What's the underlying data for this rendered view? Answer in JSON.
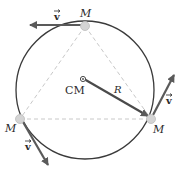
{
  "diagram": {
    "masses": [
      {
        "label": "M",
        "position": "top"
      },
      {
        "label": "M",
        "position": "bottom-right"
      },
      {
        "label": "M",
        "position": "bottom-left"
      }
    ],
    "velocity_label": "v",
    "center_label": "CM",
    "radius_label": "R",
    "colors": {
      "circle": "#3a3a3a",
      "arrow": "#5a5a5a",
      "dashed": "#c8c8c8",
      "mass": "#d4d4d4"
    }
  }
}
